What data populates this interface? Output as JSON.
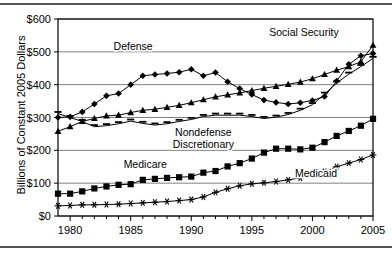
{
  "chart_data": {
    "type": "line",
    "title": "",
    "xlabel": "",
    "ylabel": "Billions of Constant 2005 Dollars",
    "xlim": [
      1979,
      2005
    ],
    "ylim": [
      0,
      600
    ],
    "grid": true,
    "legend_position": "inline-annotations",
    "x_ticks": [
      "1980",
      "1985",
      "1990",
      "1995",
      "2000",
      "2005"
    ],
    "x_tick_values": [
      1980,
      1985,
      1990,
      1995,
      2000,
      2005
    ],
    "y_ticks": [
      "$0",
      "$100",
      "$200",
      "$300",
      "$400",
      "$500",
      "$600"
    ],
    "y_tick_values": [
      0,
      100,
      200,
      300,
      400,
      500,
      600
    ],
    "x": [
      1979,
      1980,
      1981,
      1982,
      1983,
      1984,
      1985,
      1986,
      1987,
      1988,
      1989,
      1990,
      1991,
      1992,
      1993,
      1994,
      1995,
      1996,
      1997,
      1998,
      1999,
      2000,
      2001,
      2002,
      2003,
      2004,
      2005
    ],
    "series": [
      {
        "name": "Defense",
        "marker": "diamond",
        "label_x": 1985.2,
        "label_y": 505,
        "values": [
          300,
          302,
          317,
          341,
          366,
          373,
          400,
          427,
          431,
          434,
          438,
          447,
          427,
          437,
          409,
          388,
          370,
          353,
          346,
          341,
          345,
          352,
          364,
          411,
          462,
          488,
          495
        ]
      },
      {
        "name": "Social Security",
        "marker": "triangle",
        "label_x": 1999.3,
        "label_y": 547,
        "values": [
          258,
          272,
          288,
          297,
          305,
          307,
          315,
          322,
          325,
          331,
          337,
          345,
          354,
          363,
          369,
          375,
          382,
          389,
          395,
          401,
          408,
          418,
          431,
          444,
          455,
          470,
          520
        ]
      },
      {
        "name": "Nondefense Discretionary",
        "marker": "dash",
        "label_x": 1991.0,
        "label_y": 243,
        "values": [
          312,
          300,
          288,
          272,
          275,
          281,
          289,
          282,
          277,
          281,
          288,
          294,
          303,
          307,
          307,
          307,
          303,
          297,
          301,
          309,
          322,
          339,
          371,
          405,
          432,
          455,
          480
        ]
      },
      {
        "name": "Medicare",
        "marker": "square",
        "label_x": 1986.2,
        "label_y": 147,
        "values": [
          68,
          68,
          75,
          84,
          90,
          95,
          97,
          110,
          113,
          116,
          118,
          120,
          132,
          137,
          151,
          161,
          175,
          193,
          205,
          205,
          203,
          208,
          225,
          244,
          259,
          275,
          296
        ]
      },
      {
        "name": "Medicaid",
        "marker": "asterisk",
        "label_x": 2000.3,
        "label_y": 118,
        "values": [
          31,
          32,
          34,
          34,
          35,
          36,
          38,
          40,
          42,
          44,
          47,
          50,
          58,
          72,
          83,
          92,
          98,
          101,
          105,
          110,
          116,
          124,
          136,
          150,
          161,
          172,
          186
        ]
      }
    ]
  }
}
